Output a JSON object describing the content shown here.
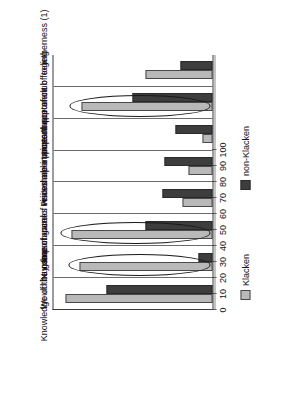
{
  "chart_data": {
    "type": "bar",
    "title": "",
    "subtitle": "",
    "xlabel": "",
    "ylabel": "",
    "ylim": [
      0,
      100
    ],
    "grid": false,
    "orientation": "vertical-rotated-90ccw",
    "legend_position": "right",
    "categories": [
      "Knowledge of the game",
      "Would buy season card",
      "Number of games visited",
      "Importance of reasonable prices",
      "Prices are important",
      "Importance of opponent",
      "Importance of club feeling",
      "Importance of togetherness (1)"
    ],
    "tick_labels": [
      "0",
      "10",
      "20",
      "30",
      "40",
      "50",
      "60",
      "70",
      "80",
      "90",
      "100"
    ],
    "tick_values": [
      0,
      10,
      20,
      30,
      40,
      50,
      60,
      70,
      80,
      90,
      100
    ],
    "series": [
      {
        "name": "Klacken",
        "color": "#b9b9b9",
        "values": [
          92,
          83,
          88,
          19,
          15,
          6,
          82,
          42
        ]
      },
      {
        "name": "non-Klacken",
        "color": "#3d3d3d",
        "values": [
          66,
          9,
          42,
          31,
          30,
          23,
          50,
          20
        ]
      }
    ],
    "annotations": [
      {
        "name": "ellipse-highlight-season-card",
        "category_index": 1,
        "shape": "ellipse"
      },
      {
        "name": "ellipse-highlight-games-visited",
        "category_index": 2,
        "shape": "ellipse"
      },
      {
        "name": "ellipse-highlight-club-feeling",
        "category_index": 6,
        "shape": "ellipse"
      }
    ]
  },
  "legend": {
    "items": [
      {
        "label": "Klacken",
        "color": "#b9b9b9"
      },
      {
        "label": "non-Klacken",
        "color": "#3d3d3d"
      }
    ]
  }
}
